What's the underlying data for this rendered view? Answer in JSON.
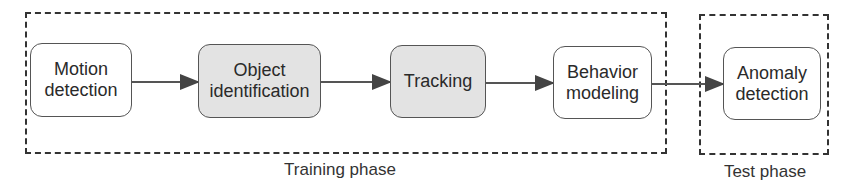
{
  "phases": [
    {
      "label": "Training phase"
    },
    {
      "label": "Test phase"
    }
  ],
  "nodes": [
    {
      "label": "Motion\ndetection",
      "fill": "white"
    },
    {
      "label": "Object\nidentification",
      "fill": "gray"
    },
    {
      "label": "Tracking",
      "fill": "gray"
    },
    {
      "label": "Behavior\nmodeling",
      "fill": "white"
    },
    {
      "label": "Anomaly\ndetection",
      "fill": "white"
    }
  ],
  "edges": [
    {
      "from": "Motion detection",
      "to": "Object identification"
    },
    {
      "from": "Object identification",
      "to": "Tracking"
    },
    {
      "from": "Tracking",
      "to": "Behavior modeling"
    },
    {
      "from": "Behavior modeling",
      "to": "Anomaly detection"
    }
  ],
  "colors": {
    "gray_fill": "#e3e3e3",
    "stroke": "#333333"
  }
}
